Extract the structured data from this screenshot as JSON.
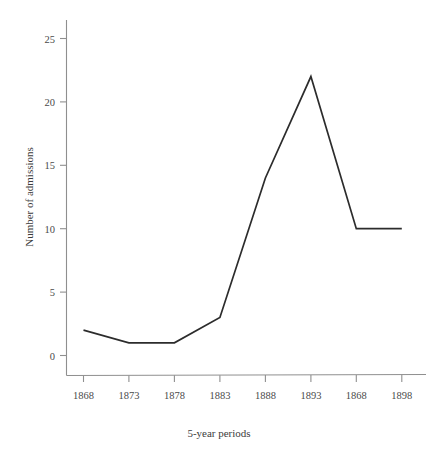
{
  "chart_data": {
    "type": "line",
    "title": "",
    "subtitle": "",
    "xlabel": "5-year periods",
    "ylabel": "Number of admissions",
    "categories": [
      "1868",
      "1873",
      "1878",
      "1883",
      "1888",
      "1893",
      "1868",
      "1898"
    ],
    "values": [
      2,
      1,
      1,
      3,
      14,
      22,
      10,
      10
    ],
    "series": [
      {
        "name": "Number of admissions",
        "values": [
          2,
          1,
          1,
          3,
          14,
          22,
          10,
          10
        ]
      }
    ],
    "ylim": [
      0,
      26
    ],
    "yticks": [
      0,
      5,
      10,
      15,
      20,
      25
    ],
    "ytick_labels": [
      "0",
      "5",
      "10",
      "15",
      "20",
      "25"
    ],
    "xtick_labels": [
      "1868",
      "1873",
      "1878",
      "1883",
      "1888",
      "1893",
      "1868",
      "1898"
    ],
    "grid": false,
    "legend": false,
    "legend_position": "none",
    "annotations": [],
    "markers": false,
    "line_color": "#2c2c2c",
    "axis_color": "#8f8f8f",
    "text_color": "#4a4a4a",
    "background_color": "#ffffff"
  },
  "axes": {
    "y_axis_title": "Number of admissions",
    "x_axis_title": "5-year periods",
    "y_ticks": [
      {
        "label": "25",
        "value": 25
      },
      {
        "label": "20",
        "value": 20
      },
      {
        "label": "15",
        "value": 15
      },
      {
        "label": "10",
        "value": 10
      },
      {
        "label": "5",
        "value": 5
      },
      {
        "label": "0",
        "value": 0
      }
    ],
    "x_ticks": [
      {
        "label": "1868",
        "value": 2
      },
      {
        "label": "1873",
        "value": 1
      },
      {
        "label": "1878",
        "value": 1
      },
      {
        "label": "1883",
        "value": 3
      },
      {
        "label": "1888",
        "value": 14
      },
      {
        "label": "1893",
        "value": 22
      },
      {
        "label": "1868",
        "value": 10
      },
      {
        "label": "1898",
        "value": 10
      }
    ]
  }
}
